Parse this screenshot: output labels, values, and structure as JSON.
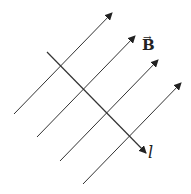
{
  "diagram": {
    "field": {
      "label": "B",
      "vector_mark": "→",
      "lines": [
        {
          "x1": 14,
          "y1": 114,
          "x2": 112,
          "y2": 13
        },
        {
          "x1": 37,
          "y1": 137,
          "x2": 135,
          "y2": 36
        },
        {
          "x1": 60,
          "y1": 161,
          "x2": 158,
          "y2": 60
        },
        {
          "x1": 83,
          "y1": 184,
          "x2": 181,
          "y2": 83
        }
      ]
    },
    "conductor": {
      "label": "l",
      "x1": 47,
      "y1": 52,
      "x2": 146,
      "y2": 153
    },
    "colors": {
      "line": "#333333",
      "text": "#222222"
    }
  }
}
